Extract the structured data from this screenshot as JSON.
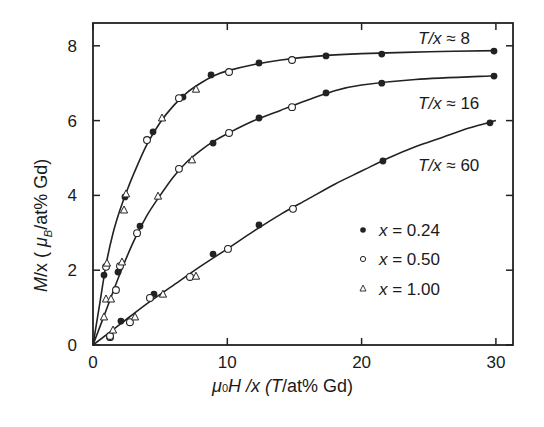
{
  "chart_data": {
    "type": "scatter",
    "title": "",
    "xlabel": "μ0H /x (T/at% Gd)",
    "ylabel": "M/x ( μB/at% Gd)",
    "xlim": [
      0,
      31.2
    ],
    "ylim": [
      0,
      8.6
    ],
    "xticks": [
      0,
      10,
      20,
      30
    ],
    "yticks": [
      0,
      2,
      4,
      6,
      8
    ],
    "grid": false,
    "legend_position": "inside lower right",
    "legend": [
      {
        "marker": "filled-circle",
        "label": "x = 0.24"
      },
      {
        "marker": "open-circle",
        "label": "x = 0.50"
      },
      {
        "marker": "open-triangle",
        "label": "x = 1.00"
      }
    ],
    "annotations": [
      {
        "text": "T/x ≈ 8",
        "near_curve": "T/x≈8"
      },
      {
        "text": "T/x ≈ 16",
        "near_curve": "T/x≈16"
      },
      {
        "text": "T/x ≈ 60",
        "near_curve": "T/x≈60"
      }
    ],
    "curves": [
      {
        "name": "T/x≈8",
        "fit_line": [
          [
            0,
            0
          ],
          [
            0.5,
            1.1
          ],
          [
            1,
            2.2
          ],
          [
            1.5,
            3.0
          ],
          [
            2,
            3.6
          ],
          [
            2.5,
            4.1
          ],
          [
            3,
            4.55
          ],
          [
            4,
            5.35
          ],
          [
            5,
            5.95
          ],
          [
            6,
            6.4
          ],
          [
            7,
            6.75
          ],
          [
            8,
            7.0
          ],
          [
            9,
            7.2
          ],
          [
            10,
            7.33
          ],
          [
            12,
            7.5
          ],
          [
            14,
            7.62
          ],
          [
            17,
            7.73
          ],
          [
            20,
            7.79
          ],
          [
            25,
            7.84
          ],
          [
            30,
            7.87
          ]
        ],
        "series": [
          {
            "name": "x = 0.24",
            "marker": "filled-circle",
            "points": [
              [
                0.82,
                1.87
              ],
              [
                2.38,
                3.96
              ],
              [
                4.47,
                5.7
              ],
              [
                6.7,
                6.63
              ],
              [
                8.79,
                7.22
              ],
              [
                12.36,
                7.54
              ],
              [
                17.35,
                7.73
              ],
              [
                21.5,
                7.78
              ],
              [
                29.86,
                7.86
              ]
            ]
          },
          {
            "name": "x = 0.50",
            "marker": "open-circle",
            "points": [
              [
                0.97,
                2.09
              ],
              [
                4.02,
                5.48
              ],
              [
                6.4,
                6.6
              ],
              [
                10.13,
                7.3
              ],
              [
                14.82,
                7.62
              ]
            ]
          },
          {
            "name": "x = 1.00",
            "marker": "open-triangle",
            "points": [
              [
                0.82,
                0.75
              ],
              [
                0.97,
                1.23
              ],
              [
                1.04,
                2.19
              ],
              [
                2.31,
                3.61
              ],
              [
                2.46,
                4.04
              ],
              [
                5.14,
                6.07
              ],
              [
                7.67,
                6.84
              ]
            ]
          }
        ]
      },
      {
        "name": "T/x≈16",
        "fit_line": [
          [
            0,
            0
          ],
          [
            1,
            0.95
          ],
          [
            2,
            1.9
          ],
          [
            3,
            2.75
          ],
          [
            4,
            3.45
          ],
          [
            5,
            4.0
          ],
          [
            6,
            4.5
          ],
          [
            7,
            4.9
          ],
          [
            8,
            5.2
          ],
          [
            9,
            5.45
          ],
          [
            10,
            5.65
          ],
          [
            12,
            6.0
          ],
          [
            14,
            6.28
          ],
          [
            16,
            6.55
          ],
          [
            18,
            6.8
          ],
          [
            20,
            6.95
          ],
          [
            24,
            7.1
          ],
          [
            30,
            7.2
          ]
        ],
        "series": [
          {
            "name": "x = 0.24",
            "marker": "filled-circle",
            "points": [
              [
                1.86,
                1.95
              ],
              [
                3.5,
                3.18
              ],
              [
                8.94,
                5.4
              ],
              [
                12.36,
                6.07
              ],
              [
                17.35,
                6.74
              ],
              [
                21.5,
                7.0
              ],
              [
                29.86,
                7.19
              ]
            ]
          },
          {
            "name": "x = 0.50",
            "marker": "open-circle",
            "points": [
              [
                1.27,
                0.21
              ],
              [
                1.71,
                1.47
              ],
              [
                2.01,
                2.11
              ],
              [
                3.28,
                2.99
              ],
              [
                6.4,
                4.71
              ],
              [
                10.13,
                5.67
              ],
              [
                14.82,
                6.36
              ]
            ]
          },
          {
            "name": "x = 1.00",
            "marker": "open-triangle",
            "points": [
              [
                1.34,
                1.23
              ],
              [
                2.16,
                2.22
              ],
              [
                4.84,
                3.98
              ],
              [
                7.37,
                4.95
              ]
            ]
          }
        ]
      },
      {
        "name": "T/x≈60",
        "fit_line": [
          [
            0,
            0
          ],
          [
            2,
            0.55
          ],
          [
            4,
            1.1
          ],
          [
            6,
            1.6
          ],
          [
            8,
            2.1
          ],
          [
            10,
            2.57
          ],
          [
            12,
            3.05
          ],
          [
            14,
            3.5
          ],
          [
            16,
            3.9
          ],
          [
            18,
            4.3
          ],
          [
            20,
            4.65
          ],
          [
            22,
            5.0
          ],
          [
            24,
            5.3
          ],
          [
            26,
            5.55
          ],
          [
            28,
            5.8
          ],
          [
            30,
            6.0
          ]
        ],
        "series": [
          {
            "name": "x = 0.24",
            "marker": "filled-circle",
            "points": [
              [
                2.08,
                0.64
              ],
              [
                4.54,
                1.36
              ],
              [
                8.94,
                2.43
              ],
              [
                12.36,
                3.21
              ],
              [
                21.59,
                4.92
              ],
              [
                29.56,
                5.94
              ]
            ]
          },
          {
            "name": "x = 0.50",
            "marker": "open-circle",
            "points": [
              [
                1.27,
                0.24
              ],
              [
                2.75,
                0.61
              ],
              [
                4.24,
                1.26
              ],
              [
                7.22,
                1.82
              ],
              [
                10.05,
                2.57
              ],
              [
                14.89,
                3.64
              ]
            ]
          },
          {
            "name": "x = 1.00",
            "marker": "open-triangle",
            "points": [
              [
                1.49,
                0.4
              ],
              [
                3.13,
                0.75
              ],
              [
                5.21,
                1.36
              ],
              [
                7.67,
                1.84
              ]
            ]
          }
        ]
      }
    ]
  },
  "labels": {
    "xlabel_mu": "μ",
    "xlabel_sub": "0",
    "xlabel_H": "H /x (",
    "xlabel_T": "T",
    "xlabel_rest": "/at% Gd)",
    "ylabel_M": "M",
    "ylabel_x": "/x ( ",
    "ylabel_mu": "μ",
    "ylabel_B": "B",
    "ylabel_rest": "/at% Gd)",
    "ann_8_T": "T/x",
    "ann_8_v": " ≈ 8",
    "ann_16_T": "T/x",
    "ann_16_v": " ≈ 16",
    "ann_60_T": "T/x",
    "ann_60_v": " ≈ 60",
    "leg_1_x": "x",
    "leg_1_v": " = 0.24",
    "leg_2_x": "x",
    "leg_2_v": " = 0.50",
    "leg_3_x": "x",
    "leg_3_v": " = 1.00"
  }
}
